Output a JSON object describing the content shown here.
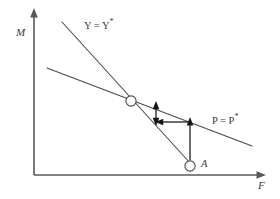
{
  "figure": {
    "background_color": "#ffffff",
    "axes": {
      "y_label": "M",
      "x_label": "F",
      "axis_color": "#58585a",
      "origin": {
        "x": 34,
        "y": 175
      },
      "y_top": {
        "x": 34,
        "y": 10
      },
      "x_right": {
        "x": 265,
        "y": 175
      }
    },
    "curves": [
      {
        "name": "y-equilibrium-line",
        "label_text": "Y = Y",
        "label_star": "*",
        "description": "steep downward sloping locus",
        "color": "#4a4a4c",
        "start": {
          "x": 62,
          "y": 22
        },
        "end": {
          "x": 190,
          "y": 166
        }
      },
      {
        "name": "p-equilibrium-line",
        "label_text": "P = P",
        "label_star": "*",
        "description": "shallow downward sloping locus",
        "color": "#4a4a4c",
        "start": {
          "x": 47,
          "y": 68
        },
        "end": {
          "x": 252,
          "y": 146
        }
      }
    ],
    "nodes": [
      {
        "name": "equilibrium-point",
        "label": "",
        "x": 131,
        "y": 101,
        "radius": 5.1
      },
      {
        "name": "point-a",
        "label": "A",
        "x": 190,
        "y": 166,
        "radius": 5.1
      }
    ],
    "arrows": [
      {
        "name": "vertical-double-arrow",
        "direction": "double-vertical",
        "x": 156,
        "y_top": 103,
        "y_bottom": 124,
        "color": "#16161a"
      },
      {
        "name": "horizontal-left-arrow",
        "direction": "left",
        "y": 122,
        "x_start": 190,
        "x_end": 157,
        "color": "#16161a"
      },
      {
        "name": "vertical-up-arrow-from-a",
        "direction": "up",
        "x": 190,
        "y_start": 160,
        "y_end": 119,
        "color": "#16161a"
      }
    ]
  }
}
